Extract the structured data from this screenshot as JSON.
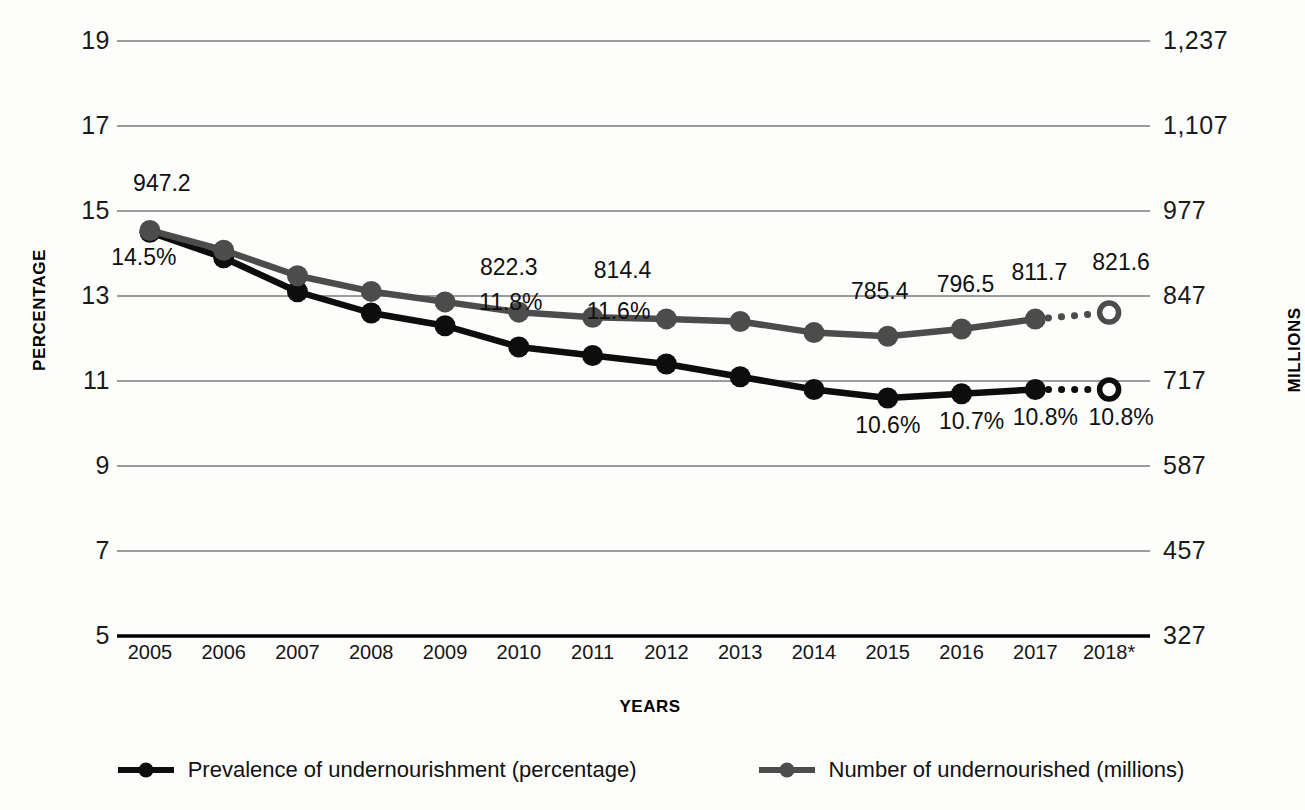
{
  "chart_data": {
    "type": "line",
    "title": "",
    "xlabel": "YEARS",
    "ylabel_left": "PERCENTAGE",
    "ylabel_right": "MILLIONS",
    "categories": [
      "2005",
      "2006",
      "2007",
      "2008",
      "2009",
      "2010",
      "2011",
      "2012",
      "2013",
      "2014",
      "2015",
      "2016",
      "2017",
      "2018*"
    ],
    "ylim_left": [
      5,
      19
    ],
    "ylim_right": [
      327,
      1237
    ],
    "yticks_left": [
      "19",
      "17",
      "15",
      "13",
      "11",
      "9",
      "7",
      "5"
    ],
    "yticks_left_values": [
      19,
      17,
      15,
      13,
      11,
      9,
      7,
      5
    ],
    "yticks_right": [
      "1,237",
      "1,107",
      "977",
      "847",
      "717",
      "587",
      "457",
      "327"
    ],
    "yticks_right_values": [
      1237,
      1107,
      977,
      847,
      717,
      587,
      457,
      327
    ],
    "grid": true,
    "legend_position": "bottom",
    "series": [
      {
        "name": "Prevalence of undernourishment (percentage)",
        "unit": "percentage",
        "axis": "left",
        "color": "#0d0d0d",
        "values": [
          14.5,
          13.9,
          13.1,
          12.6,
          12.3,
          11.8,
          11.6,
          11.4,
          11.1,
          10.8,
          10.6,
          10.7,
          10.8,
          10.8
        ],
        "projected_from": "2017",
        "labels": [
          {
            "category": "2005",
            "text": "14.5%"
          },
          {
            "category": "2010",
            "text": "11.8%"
          },
          {
            "category": "2011",
            "text": "11.6%"
          },
          {
            "category": "2015",
            "text": "10.6%"
          },
          {
            "category": "2016",
            "text": "10.7%"
          },
          {
            "category": "2017",
            "text": "10.8%"
          },
          {
            "category": "2018*",
            "text": "10.8%"
          }
        ]
      },
      {
        "name": "Number of undernourished (millions)",
        "unit": "millions",
        "axis": "right",
        "color": "#4c4c4c",
        "values": [
          947.2,
          917.0,
          878.0,
          854.0,
          838.0,
          822.3,
          814.4,
          812.0,
          808.0,
          791.0,
          785.4,
          796.5,
          811.7,
          821.6
        ],
        "projected_from": "2017",
        "labels": [
          {
            "category": "2005",
            "text": "947.2"
          },
          {
            "category": "2010",
            "text": "822.3"
          },
          {
            "category": "2011",
            "text": "814.4"
          },
          {
            "category": "2015",
            "text": "785.4"
          },
          {
            "category": "2016",
            "text": "796.5"
          },
          {
            "category": "2017",
            "text": "811.7"
          },
          {
            "category": "2018*",
            "text": "821.6"
          }
        ]
      }
    ],
    "footnote": "* Projected value."
  },
  "axes": {
    "left": {
      "title": "PERCENTAGE",
      "ticks": [
        "19",
        "17",
        "15",
        "13",
        "11",
        "9",
        "7",
        "5"
      ]
    },
    "right": {
      "title": "MILLIONS",
      "ticks": [
        "1,237",
        "1,107",
        "977",
        "847",
        "717",
        "587",
        "457",
        "327"
      ]
    },
    "x": {
      "title": "YEARS",
      "ticks": [
        "2005",
        "2006",
        "2007",
        "2008",
        "2009",
        "2010",
        "2011",
        "2012",
        "2013",
        "2014",
        "2015",
        "2016",
        "2017",
        "2018*"
      ]
    }
  },
  "data_labels": {
    "gray": [
      "947.2",
      "822.3",
      "814.4",
      "785.4",
      "796.5",
      "811.7",
      "821.6"
    ],
    "black": [
      "14.5%",
      "11.8%",
      "11.6%",
      "10.6%",
      "10.7%",
      "10.8%",
      "10.8%"
    ]
  },
  "legend": {
    "items": [
      {
        "label": "Prevalence of undernourishment (percentage)",
        "color": "#0d0d0d",
        "marker": "line-dot-marker"
      },
      {
        "label": "Number of undernourished (millions)",
        "color": "#4c4c4c",
        "marker": "line-dot-marker"
      }
    ]
  }
}
